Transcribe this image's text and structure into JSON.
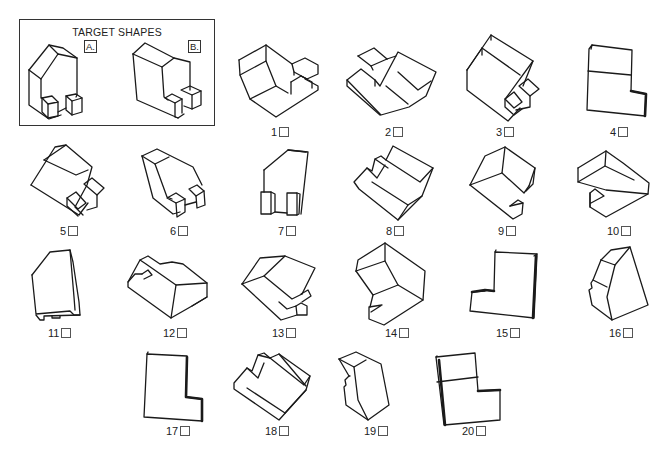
{
  "target": {
    "title": "TARGET SHAPES",
    "shapes": [
      {
        "tag": "A.",
        "description": "arch shape with chamfered top and two small blocks at base"
      },
      {
        "tag": "B.",
        "description": "tall slab with L-notch and two small blocks at base"
      }
    ]
  },
  "options": [
    {
      "number": "1",
      "checked": false
    },
    {
      "number": "2",
      "checked": false
    },
    {
      "number": "3",
      "checked": false
    },
    {
      "number": "4",
      "checked": false
    },
    {
      "number": "5",
      "checked": false
    },
    {
      "number": "6",
      "checked": false
    },
    {
      "number": "7",
      "checked": false
    },
    {
      "number": "8",
      "checked": false
    },
    {
      "number": "9",
      "checked": false
    },
    {
      "number": "10",
      "checked": false
    },
    {
      "number": "11",
      "checked": false
    },
    {
      "number": "12",
      "checked": false
    },
    {
      "number": "13",
      "checked": false
    },
    {
      "number": "14",
      "checked": false
    },
    {
      "number": "15",
      "checked": false
    },
    {
      "number": "16",
      "checked": false
    },
    {
      "number": "17",
      "checked": false
    },
    {
      "number": "18",
      "checked": false
    },
    {
      "number": "19",
      "checked": false
    },
    {
      "number": "20",
      "checked": false
    }
  ],
  "colors": {
    "line": "#1a1a1a",
    "background": "#ffffff"
  }
}
